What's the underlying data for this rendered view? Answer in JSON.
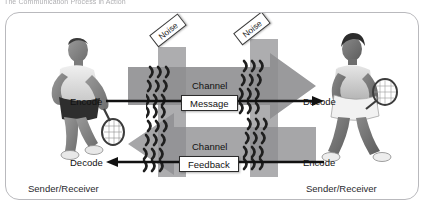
{
  "header": {
    "title": "The Communication Process in Action"
  },
  "diagram": {
    "noise_tags": [
      {
        "label": "Noise",
        "position": "left"
      },
      {
        "label": "Noise",
        "position": "right"
      }
    ],
    "channels": [
      {
        "caption": "Channel",
        "flow_label": "Message",
        "direction": "right"
      },
      {
        "caption": "Channel",
        "flow_label": "Feedback",
        "direction": "left"
      }
    ],
    "endpoints": {
      "encode_left": "Encode",
      "decode_left": "Decode",
      "decode_right": "Decode",
      "encode_right": "Encode"
    },
    "roles": {
      "left": "Sender/Receiver",
      "right": "Sender/Receiver"
    },
    "figures": {
      "left_alt": "male-tennis-player-photo",
      "right_alt": "female-tennis-player-photo"
    },
    "colors": {
      "arrow_gray": "#9a9a9c",
      "arrow_gray_dark": "#7e7e80",
      "noise_band": "#8e8e90",
      "frame_border": "#b9b9bd",
      "text": "#111111",
      "header_text": "#6b6b70"
    }
  }
}
